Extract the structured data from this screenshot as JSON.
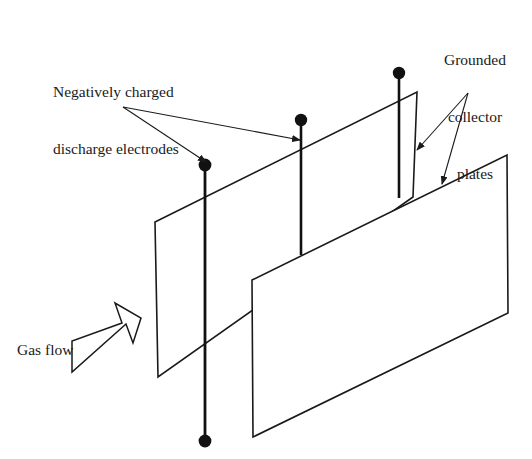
{
  "figure": {
    "background_color": "#ffffff",
    "line_color": "#1a1a1a"
  },
  "labels": {
    "discharge_electrodes": {
      "line1": "Negatively charged",
      "line2": "discharge electrodes"
    },
    "collector_plates": {
      "line1": "Grounded",
      "line2": "collector",
      "line3": "plates"
    },
    "gas_flow": "Gas flow"
  },
  "components": {
    "rear_plate": {
      "name": "grounded collector plate rear",
      "points": "155,222 417,92 413,197 158,377"
    },
    "front_plate": {
      "name": "grounded collector plate front",
      "points": "252,280 507,155 508,313 253,437"
    },
    "electrodes": [
      {
        "name": "discharge-electrode-left",
        "x": 205,
        "y_top": 165,
        "y_bottom": 441,
        "top_dot": true,
        "bottom_dot": true
      },
      {
        "name": "discharge-electrode-middle",
        "x": 301,
        "y_top": 120,
        "y_bottom": 255,
        "top_dot": true,
        "bottom_dot": false
      },
      {
        "name": "discharge-electrode-right",
        "x": 399,
        "y_top": 73,
        "y_bottom": 198,
        "top_dot": true,
        "bottom_dot": false
      }
    ],
    "gas_flow_arrow": {
      "name": "gas-flow-arrow",
      "points": "72,372 72,341 122,323 115,303 141,318 133,343 126,324"
    }
  },
  "leaders": {
    "electrodes_origin": "123,107",
    "electrode_targets": [
      "300,140",
      "206,162"
    ],
    "plates_origin": "468,93",
    "plate_targets": [
      "417,150",
      "442,184"
    ]
  }
}
